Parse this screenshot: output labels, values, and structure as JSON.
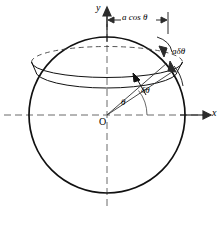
{
  "figure": {
    "type": "geometry-diagram",
    "background_color": "#ffffff",
    "stroke_color": "#1a1a1a",
    "axis_color": "#555555",
    "labels": {
      "y_axis": "y",
      "x_axis": "x",
      "origin": "O",
      "horizontal_dimension": "a cos θ",
      "band_width": "aδθ",
      "angle_increment": "δθ",
      "angle": "θ"
    },
    "geometry": {
      "circle_center": [
        107,
        115
      ],
      "circle_radius": 78,
      "band_upper_y": 62,
      "band_lower_y": 75,
      "theta_degrees": 40,
      "delta_theta_degrees": 10,
      "dimension_line_y": 20,
      "dimension_line_x_start": 107,
      "dimension_line_x_end": 168
    }
  }
}
